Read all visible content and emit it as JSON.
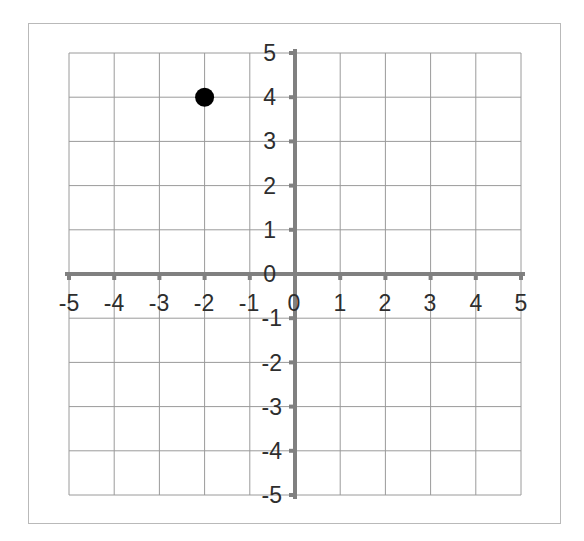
{
  "figure": {
    "title": "",
    "background_color": "#ffffff",
    "frame_color": "#b9b9b9",
    "grid_color": "#9a9a9a",
    "axis_color": "#808080",
    "point_color": "#000000",
    "label_color": "#2e2e2e"
  },
  "chart_data": {
    "type": "scatter",
    "title": "",
    "xlabel": "",
    "ylabel": "",
    "xlim": [
      -5,
      5
    ],
    "ylim": [
      -5,
      5
    ],
    "grid": true,
    "grid_step": 1,
    "legend": "none",
    "x_ticks": [
      -5,
      -4,
      -3,
      -2,
      -1,
      0,
      1,
      2,
      3,
      4,
      5
    ],
    "y_ticks": [
      -5,
      -4,
      -3,
      -2,
      -1,
      0,
      1,
      2,
      3,
      4,
      5
    ],
    "x_tick_labels": [
      "-5",
      "-4",
      "-3",
      "-2",
      "-1",
      "0",
      "1",
      "2",
      "3",
      "4",
      "5"
    ],
    "y_tick_labels": [
      "-5",
      "-4",
      "-3",
      "-2",
      "-1",
      "0",
      "1",
      "2",
      "3",
      "4",
      "5"
    ],
    "origin_label": "0",
    "series": [
      {
        "name": "plotted-point",
        "marker": "circle",
        "color": "#000000",
        "points": [
          {
            "x": -2,
            "y": 4,
            "label": "(-2, 4)"
          }
        ]
      }
    ]
  },
  "y_axis": {
    "labels": [
      "5",
      "4",
      "3",
      "2",
      "1",
      "0",
      "-1",
      "-2",
      "-3",
      "-4",
      "-5"
    ]
  },
  "x_axis": {
    "labels": [
      "-5",
      "-4",
      "-3",
      "-2",
      "-1",
      "0",
      "1",
      "2",
      "3",
      "4",
      "5"
    ]
  }
}
